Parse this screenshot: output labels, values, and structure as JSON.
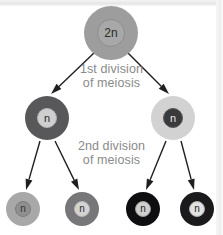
{
  "diagram": {
    "labels": [
      {
        "id": "first-division",
        "line1": "1st division",
        "line2": "of meiosis",
        "color": "#8a8a8a"
      },
      {
        "id": "second-division",
        "line1": "2nd division",
        "line2": "of meiosis",
        "color": "#8a8a8a"
      }
    ],
    "cells": [
      {
        "id": "parent-cell",
        "ploidy": "2n",
        "generation": "parent",
        "cx": 111,
        "cy": 33,
        "r": 27,
        "cytoplasm_color": "#9d9d9d",
        "nucleus_r": 14,
        "nucleus_color": "#a8a8a8",
        "nucleus_ring": "#8c8c8c",
        "text_color": "#2b2b2b",
        "font_size": 12
      },
      {
        "id": "daughter-cell-left",
        "ploidy": "n",
        "generation": "after-first-division",
        "cx": 47,
        "cy": 118,
        "r": 22,
        "cytoplasm_color": "#58585a",
        "nucleus_r": 10,
        "nucleus_color": "#cfcfcf",
        "nucleus_ring": "#b3b3b3",
        "text_color": "#2b2b2b",
        "font_size": 11
      },
      {
        "id": "daughter-cell-right",
        "ploidy": "n",
        "generation": "after-first-division",
        "cx": 173,
        "cy": 118,
        "r": 22,
        "cytoplasm_color": "#d2d2d2",
        "nucleus_r": 10,
        "nucleus_color": "#3a3a3c",
        "nucleus_ring": "#58585a",
        "text_color": "#e8e8e8",
        "font_size": 11
      },
      {
        "id": "gamete-cell-1",
        "ploidy": "n",
        "generation": "after-second-division",
        "cx": 23,
        "cy": 209,
        "r": 17,
        "cytoplasm_color": "#a8a8a8",
        "nucleus_r": 8,
        "nucleus_color": "#8f8f8f",
        "nucleus_ring": "#7c7c7c",
        "text_color": "#333335",
        "font_size": 10
      },
      {
        "id": "gamete-cell-2",
        "ploidy": "n",
        "generation": "after-second-division",
        "cx": 82,
        "cy": 209,
        "r": 17,
        "cytoplasm_color": "#777779",
        "nucleus_r": 8,
        "nucleus_color": "#d3d3d3",
        "nucleus_ring": "#b6b6b6",
        "text_color": "#2b2b2b",
        "font_size": 10
      },
      {
        "id": "gamete-cell-3",
        "ploidy": "n",
        "generation": "after-second-division",
        "cx": 143,
        "cy": 209,
        "r": 17,
        "cytoplasm_color": "#0e0e10",
        "nucleus_r": 8,
        "nucleus_color": "#cfcfcf",
        "nucleus_ring": "#9a9a9a",
        "text_color": "#232325",
        "font_size": 10
      },
      {
        "id": "gamete-cell-4",
        "ploidy": "n",
        "generation": "after-second-division",
        "cx": 197,
        "cy": 209,
        "r": 17,
        "cytoplasm_color": "#1a1a1c",
        "nucleus_r": 8,
        "nucleus_color": "#e2e2e2",
        "nucleus_ring": "#aaaaaa",
        "text_color": "#232325",
        "font_size": 10
      }
    ],
    "arrows": [
      {
        "id": "arrow-parent-to-left",
        "x1": 95,
        "y1": 52,
        "x2": 51,
        "y2": 94
      },
      {
        "id": "arrow-parent-to-right",
        "x1": 127,
        "y1": 52,
        "x2": 169,
        "y2": 94
      },
      {
        "id": "arrow-left-to-g1",
        "x1": 40,
        "y1": 141,
        "x2": 26,
        "y2": 190
      },
      {
        "id": "arrow-left-to-g2",
        "x1": 55,
        "y1": 141,
        "x2": 79,
        "y2": 190
      },
      {
        "id": "arrow-right-to-g3",
        "x1": 166,
        "y1": 141,
        "x2": 146,
        "y2": 190
      },
      {
        "id": "arrow-right-to-g4",
        "x1": 181,
        "y1": 141,
        "x2": 194,
        "y2": 190
      }
    ],
    "arrow_color": "#1f1f21"
  }
}
